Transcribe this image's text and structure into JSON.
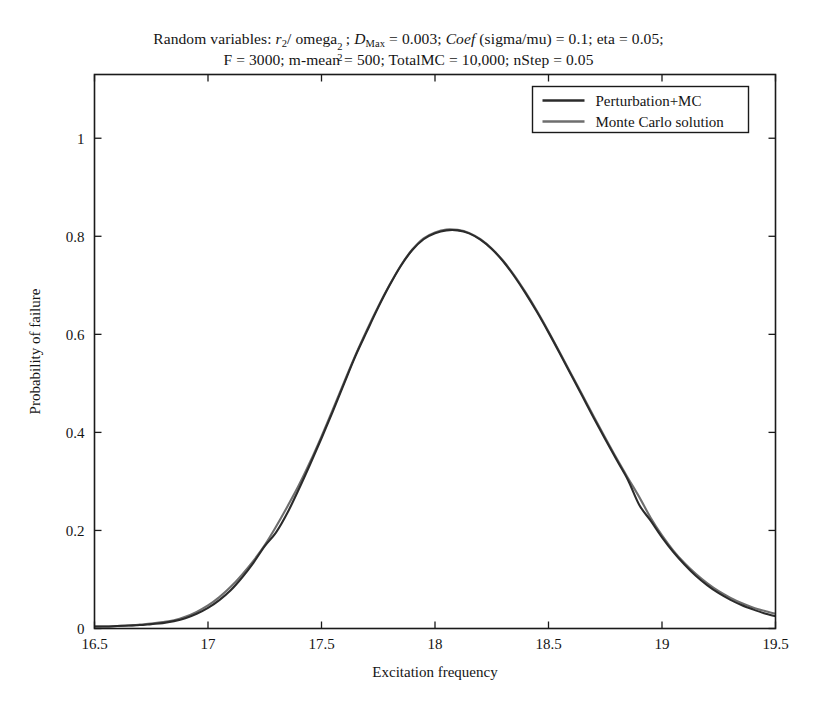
{
  "figure": {
    "title_line_1_plain": "Random variables: r2/ omega2^2; DMax = 0.003; Coef (sigma/mu) = 0.1; eta = 0.05;",
    "title_line_2": "F = 3000; m-mean = 500; TotalMC = 10,000; nStep = 0.05",
    "title_parts": {
      "prefix": "Random variables: ",
      "var_r": "r",
      "var_r_sub": "2",
      "slash": "/ omega",
      "omega_sub": "2",
      "omega_sup": "2",
      "semi1": "; ",
      "var_D": "D",
      "var_D_sub": "Max",
      "dmax_val": " = 0.003; ",
      "coef": "Coef",
      "coef_val": " (sigma/mu) = 0.1; eta = 0.05;"
    },
    "background_color": "#ffffff",
    "frame_color": "#1a1a1a"
  },
  "chart_data": {
    "type": "line",
    "xlabel": "Excitation frequency",
    "ylabel": "Probability of failure",
    "xlim": [
      16.5,
      19.5
    ],
    "ylim": [
      0,
      1.13
    ],
    "xticks": [
      16.5,
      17,
      17.5,
      18,
      18.5,
      19,
      19.5
    ],
    "xtick_labels": [
      "16.5",
      "17",
      "17.5",
      "18",
      "18.5",
      "19",
      "19.5"
    ],
    "yticks": [
      0,
      0.2,
      0.4,
      0.6,
      0.8,
      1
    ],
    "ytick_labels": [
      "0",
      "0.2",
      "0.4",
      "0.6",
      "0.8",
      "1"
    ],
    "grid": false,
    "legend_position": "upper right",
    "x": [
      16.5,
      16.55,
      16.6,
      16.65,
      16.7,
      16.75,
      16.8,
      16.85,
      16.9,
      16.95,
      17.0,
      17.05,
      17.1,
      17.15,
      17.2,
      17.25,
      17.3,
      17.35,
      17.4,
      17.45,
      17.5,
      17.55,
      17.6,
      17.65,
      17.7,
      17.75,
      17.8,
      17.85,
      17.9,
      17.95,
      18.0,
      18.05,
      18.1,
      18.15,
      18.2,
      18.25,
      18.3,
      18.35,
      18.4,
      18.45,
      18.5,
      18.55,
      18.6,
      18.65,
      18.7,
      18.75,
      18.8,
      18.85,
      18.9,
      18.95,
      19.0,
      19.05,
      19.1,
      19.15,
      19.2,
      19.25,
      19.3,
      19.35,
      19.4,
      19.45,
      19.5
    ],
    "series": [
      {
        "name": "Perturbation+MC",
        "color": "#2b2b2b",
        "linewidth": 2.1,
        "values": [
          0.004,
          0.004,
          0.005,
          0.006,
          0.007,
          0.009,
          0.011,
          0.015,
          0.021,
          0.03,
          0.042,
          0.058,
          0.078,
          0.104,
          0.134,
          0.168,
          0.196,
          0.236,
          0.284,
          0.335,
          0.388,
          0.443,
          0.5,
          0.556,
          0.606,
          0.655,
          0.7,
          0.74,
          0.772,
          0.794,
          0.806,
          0.812,
          0.812,
          0.806,
          0.793,
          0.774,
          0.749,
          0.718,
          0.683,
          0.645,
          0.604,
          0.561,
          0.517,
          0.473,
          0.429,
          0.386,
          0.344,
          0.303,
          0.252,
          0.22,
          0.186,
          0.156,
          0.13,
          0.107,
          0.088,
          0.072,
          0.059,
          0.048,
          0.039,
          0.031,
          0.025
        ]
      },
      {
        "name": "Monte Carlo solution",
        "color": "#6e6e6e",
        "linewidth": 2.1,
        "values": [
          0.004,
          0.004,
          0.005,
          0.006,
          0.008,
          0.01,
          0.013,
          0.017,
          0.024,
          0.034,
          0.047,
          0.064,
          0.085,
          0.11,
          0.138,
          0.17,
          0.208,
          0.249,
          0.292,
          0.34,
          0.392,
          0.447,
          0.503,
          0.558,
          0.609,
          0.657,
          0.701,
          0.741,
          0.773,
          0.796,
          0.808,
          0.814,
          0.813,
          0.807,
          0.794,
          0.775,
          0.75,
          0.72,
          0.685,
          0.647,
          0.606,
          0.563,
          0.519,
          0.476,
          0.432,
          0.389,
          0.347,
          0.307,
          0.268,
          0.226,
          0.19,
          0.159,
          0.133,
          0.111,
          0.092,
          0.076,
          0.063,
          0.052,
          0.043,
          0.036,
          0.03
        ]
      }
    ],
    "peak": {
      "x": 18.08,
      "y": 0.813
    }
  },
  "legend": {
    "entries": [
      {
        "label": "Perturbation+MC",
        "color": "#2b2b2b"
      },
      {
        "label": "Monte Carlo solution",
        "color": "#6e6e6e"
      }
    ]
  },
  "axes": {
    "x_title": "Excitation frequency",
    "y_title": "Probability of failure"
  }
}
